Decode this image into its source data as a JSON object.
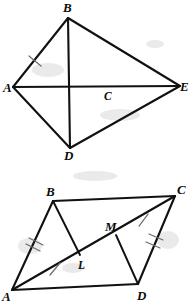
{
  "page": {
    "background_color": "#ffffff",
    "ink_color": "#111111",
    "tick_color": "#6d6d6d",
    "width": 193,
    "height": 304
  },
  "figures": [
    {
      "id": "figure-top",
      "name": "kite-abde-with-diagonals",
      "shape": "kite",
      "points": {
        "A": {
          "label": "A",
          "x": 13,
          "y": 87,
          "label_x": 3,
          "label_y": 92
        },
        "B": {
          "label": "B",
          "x": 68,
          "y": 18,
          "label_x": 63,
          "label_y": 12
        },
        "C": {
          "label": "C",
          "x": 102,
          "y": 88,
          "label_x": 104,
          "label_y": 100
        },
        "D": {
          "label": "D",
          "x": 70,
          "y": 148,
          "label_x": 64,
          "label_y": 160
        },
        "E": {
          "label": "E",
          "x": 180,
          "y": 86,
          "label_x": 180,
          "label_y": 91
        }
      },
      "segments": [
        {
          "name": "segment-AB",
          "from": "A",
          "to": "B"
        },
        {
          "name": "segment-BE",
          "from": "B",
          "to": "E"
        },
        {
          "name": "segment-ED",
          "from": "E",
          "to": "D"
        },
        {
          "name": "segment-DA",
          "from": "D",
          "to": "A"
        },
        {
          "name": "segment-AE",
          "from": "A",
          "to": "E"
        },
        {
          "name": "segment-BD",
          "from": "B",
          "to": "D"
        }
      ],
      "tick_marks": [
        {
          "name": "tick-segment-AB",
          "on": "segment-AB",
          "count": 1,
          "position": 0.38
        }
      ]
    },
    {
      "id": "figure-bottom",
      "name": "parallelogram-abcd-with-diagonal",
      "shape": "parallelogram",
      "points": {
        "A": {
          "label": "A",
          "x": 12,
          "y": 290,
          "label_x": 2,
          "label_y": 301
        },
        "B": {
          "label": "B",
          "x": 53,
          "y": 201,
          "label_x": 46,
          "label_y": 196
        },
        "C": {
          "label": "C",
          "x": 175,
          "y": 196,
          "label_x": 177,
          "label_y": 194
        },
        "D": {
          "label": "D",
          "x": 138,
          "y": 284,
          "label_x": 137,
          "label_y": 300
        },
        "L": {
          "label": "L",
          "x": 80,
          "y": 255,
          "label_x": 78,
          "label_y": 269
        },
        "M": {
          "label": "M",
          "x": 116,
          "y": 235,
          "label_x": 105,
          "label_y": 231
        }
      },
      "segments": [
        {
          "name": "segment-AB",
          "from": "A",
          "to": "B"
        },
        {
          "name": "segment-BC",
          "from": "B",
          "to": "C"
        },
        {
          "name": "segment-CD",
          "from": "C",
          "to": "D"
        },
        {
          "name": "segment-DA",
          "from": "D",
          "to": "A"
        },
        {
          "name": "diagonal-AC",
          "from": "A",
          "to": "C"
        },
        {
          "name": "segment-BL",
          "from": "B",
          "to": "L"
        },
        {
          "name": "segment-MD",
          "from": "M",
          "to": "D"
        }
      ],
      "tick_marks": [
        {
          "name": "tick-segment-AB",
          "on": "segment-AB",
          "count": 2,
          "position": 0.42
        },
        {
          "name": "tick-segment-CD",
          "on": "segment-CD",
          "count": 2,
          "position": 0.48
        },
        {
          "name": "tick-segment-AL",
          "on": "diagonal-AC",
          "count": 1,
          "position": 0.27
        },
        {
          "name": "tick-segment-MC",
          "on": "diagonal-AC",
          "count": 1,
          "position": 0.72
        }
      ]
    }
  ]
}
